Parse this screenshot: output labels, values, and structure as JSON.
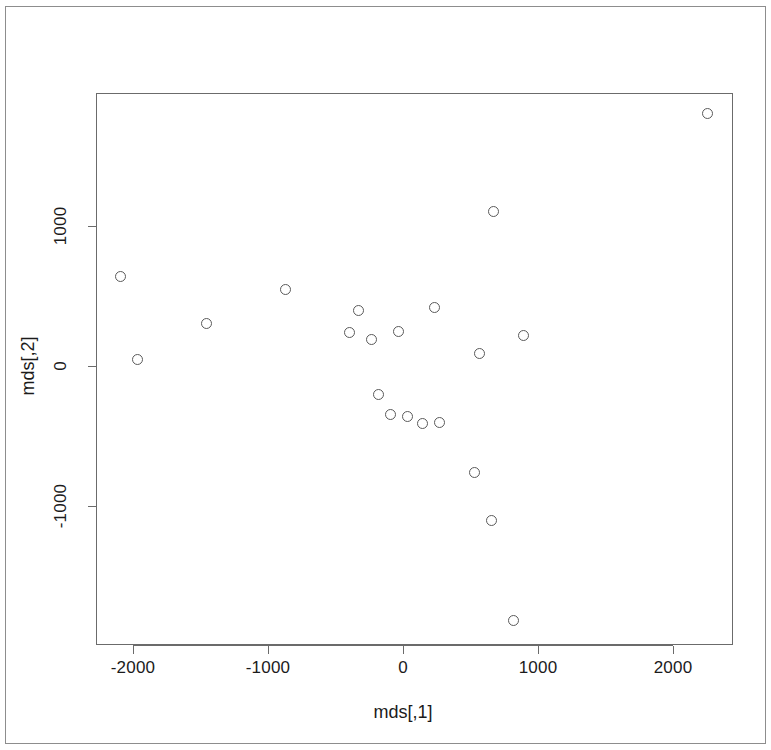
{
  "figure": {
    "kind": "r-base-scatterplot",
    "background_color": "#ffffff",
    "frame_color": "#8d8d8d",
    "axis_color": "#6b6b6b",
    "point_color": "#5a5a5a"
  },
  "chart_data": {
    "type": "scatter",
    "title": "",
    "xlabel": "mds[,1]",
    "ylabel": "mds[,2]",
    "xlim": [
      -2274,
      2444
    ],
    "ylim": [
      -1993,
      1950
    ],
    "xticks": [
      -2000,
      -1000,
      0,
      1000,
      2000
    ],
    "xtick_labels": [
      "-2000",
      "-1000",
      "0",
      "1000",
      "2000"
    ],
    "yticks": [
      -1000,
      0,
      1000
    ],
    "ytick_labels": [
      "-1000",
      "0",
      "1000"
    ],
    "grid": false,
    "legend": null,
    "marker": "open-circle",
    "n_points": 21,
    "series": [
      {
        "name": "mds",
        "x": [
          -2089,
          -1963,
          -1452,
          -874,
          -326,
          -400,
          -237,
          -37,
          237,
          570,
          674,
          889,
          2259,
          -96,
          -185,
          37,
          148,
          267,
          533,
          659,
          822
        ],
        "y": [
          636,
          43,
          307,
          543,
          393,
          236,
          186,
          243,
          421,
          86,
          1107,
          221,
          1807,
          -343,
          -200,
          -364,
          -414,
          -407,
          -764,
          -1100,
          -1821
        ]
      }
    ],
    "points": [
      {
        "x": -2089,
        "y": 636
      },
      {
        "x": -1963,
        "y": 43
      },
      {
        "x": -1452,
        "y": 307
      },
      {
        "x": -874,
        "y": 543
      },
      {
        "x": -326,
        "y": 393
      },
      {
        "x": -400,
        "y": 236
      },
      {
        "x": -237,
        "y": 186
      },
      {
        "x": -37,
        "y": 243
      },
      {
        "x": 237,
        "y": 421
      },
      {
        "x": 570,
        "y": 86
      },
      {
        "x": 674,
        "y": 1107
      },
      {
        "x": 889,
        "y": 221
      },
      {
        "x": 2259,
        "y": 1807
      },
      {
        "x": -96,
        "y": -343
      },
      {
        "x": -185,
        "y": -200
      },
      {
        "x": 37,
        "y": -364
      },
      {
        "x": 148,
        "y": -414
      },
      {
        "x": 267,
        "y": -407
      },
      {
        "x": 533,
        "y": -764
      },
      {
        "x": 659,
        "y": -1100
      },
      {
        "x": 822,
        "y": -1821
      }
    ]
  },
  "axes": {
    "x_title": "mds[,1]",
    "y_title": "mds[,2]",
    "x_ticks": [
      {
        "label": "-2000",
        "px": 133
      },
      {
        "label": "-1000",
        "px": 268
      },
      {
        "label": "0",
        "px": 403
      },
      {
        "label": "1000",
        "px": 538
      },
      {
        "label": "2000",
        "px": 673
      }
    ],
    "y_ticks": [
      {
        "label": "1000",
        "px": 226
      },
      {
        "label": "0",
        "px": 366
      },
      {
        "label": "-1000",
        "px": 506
      }
    ]
  }
}
